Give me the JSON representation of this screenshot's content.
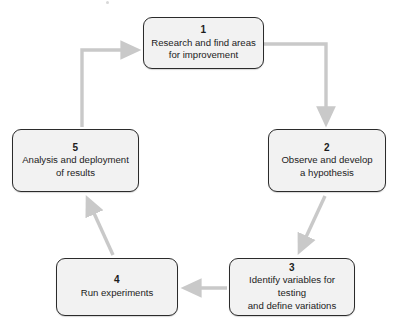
{
  "diagram": {
    "colors": {
      "node_fill": "#f2f2f2",
      "node_border": "#2b2b2b",
      "arrow": "#c9c9c9",
      "text": "#1c1c1c",
      "background": "#ffffff"
    },
    "nodes": [
      {
        "id": "1",
        "number": "1",
        "label": "Research and find areas\nfor improvement"
      },
      {
        "id": "2",
        "number": "2",
        "label": "Observe and develop\na hypothesis"
      },
      {
        "id": "3",
        "number": "3",
        "label": "Identify variables for testing\nand define variations"
      },
      {
        "id": "4",
        "number": "4",
        "label": "Run experiments"
      },
      {
        "id": "5",
        "number": "5",
        "label": "Analysis and deployment\nof results"
      }
    ],
    "connectors": [
      {
        "id": "c1",
        "from": "1",
        "to": "2",
        "shape": "elbow-right-down"
      },
      {
        "id": "c2",
        "from": "2",
        "to": "3",
        "shape": "diagonal-down-left"
      },
      {
        "id": "c3",
        "from": "3",
        "to": "4",
        "shape": "straight-left"
      },
      {
        "id": "c4",
        "from": "4",
        "to": "5",
        "shape": "diagonal-up-left"
      },
      {
        "id": "c5",
        "from": "5",
        "to": "1",
        "shape": "elbow-up-right"
      }
    ]
  }
}
